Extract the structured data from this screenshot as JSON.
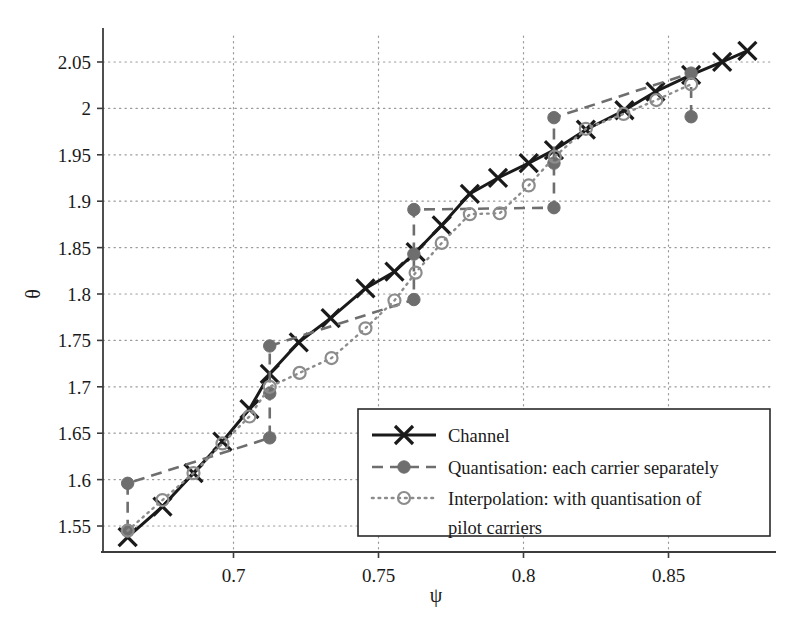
{
  "chart_data": {
    "type": "line",
    "title": "",
    "xlabel": "ψ",
    "ylabel": "θ",
    "xlim": [
      0.655,
      0.885
    ],
    "ylim": [
      1.522,
      2.078
    ],
    "xticks": [
      0.7,
      0.75,
      0.8,
      0.85
    ],
    "xtick_labels": [
      "0.7",
      "0.75",
      "0.8",
      "0.85"
    ],
    "yticks": [
      1.55,
      1.6,
      1.65,
      1.7,
      1.75,
      1.8,
      1.85,
      1.9,
      1.95,
      2.0,
      2.05
    ],
    "ytick_labels": [
      "1.55",
      "1.6",
      "1.65",
      "1.7",
      "1.75",
      "1.8",
      "1.85",
      "1.9",
      "1.95",
      "2",
      "2.05"
    ],
    "grid": true,
    "grid_style": "dotted",
    "legend_position": "lower right",
    "series": [
      {
        "name": "Channel",
        "key": "channel",
        "marker": "x",
        "linestyle": "solid",
        "color": "#1a1a1a",
        "x": [
          0.6635,
          0.6755,
          0.6862,
          0.6962,
          0.7055,
          0.7125,
          0.7225,
          0.7335,
          0.7455,
          0.7555,
          0.7628,
          0.7718,
          0.7815,
          0.7912,
          0.8018,
          0.8105,
          0.8215,
          0.8348,
          0.8455,
          0.8578,
          0.8685,
          0.8772
        ],
        "y": [
          1.538,
          1.571,
          1.607,
          1.641,
          1.676,
          1.714,
          1.748,
          1.774,
          1.806,
          1.824,
          1.845,
          1.874,
          1.908,
          1.925,
          1.941,
          1.955,
          1.977,
          1.998,
          2.018,
          2.036,
          2.05,
          2.062
        ]
      },
      {
        "name": "Quantisation: each carrier separately",
        "key": "quantisation",
        "marker": "filled-circle",
        "linestyle": "dashed",
        "color": "#6e6e6e",
        "x": [
          0.6635,
          0.6635,
          0.7125,
          0.7125,
          0.7125,
          0.7622,
          0.7622,
          0.7622,
          0.8105,
          0.8105,
          0.8105,
          0.8578,
          0.8578
        ],
        "y": [
          1.545,
          1.596,
          1.645,
          1.693,
          1.744,
          1.794,
          1.843,
          1.891,
          1.893,
          1.941,
          1.99,
          2.038,
          1.991
        ]
      },
      {
        "name": "Interpolation: with quantisation of pilot carriers",
        "key": "interpolation",
        "marker": "open-circle",
        "linestyle": "dotted",
        "color": "#8c8c8c",
        "x": [
          0.6635,
          0.6755,
          0.6862,
          0.6962,
          0.7055,
          0.7125,
          0.7228,
          0.7338,
          0.7455,
          0.7555,
          0.7628,
          0.7718,
          0.7815,
          0.7918,
          0.8018,
          0.8108,
          0.8215,
          0.8345,
          0.8458,
          0.8578
        ],
        "y": [
          1.545,
          1.578,
          1.607,
          1.639,
          1.668,
          1.7,
          1.715,
          1.731,
          1.763,
          1.793,
          1.823,
          1.855,
          1.886,
          1.887,
          1.917,
          1.948,
          1.978,
          1.994,
          2.009,
          2.026
        ]
      }
    ]
  },
  "legend": {
    "entries": [
      {
        "label": "Channel",
        "label2": ""
      },
      {
        "label": "Quantisation: each carrier separately",
        "label2": ""
      },
      {
        "label": "Interpolation: with quantisation of",
        "label2": "pilot carriers"
      }
    ]
  },
  "axes": {
    "y_title": "θ",
    "x_title": "ψ"
  },
  "colors": {
    "channel": "#1a1a1a",
    "quantisation": "#6e6e6e",
    "interpolation": "#8c8c8c",
    "grid": "#9a9a9a",
    "axis": "#3c3c3c",
    "background": "#ffffff"
  }
}
